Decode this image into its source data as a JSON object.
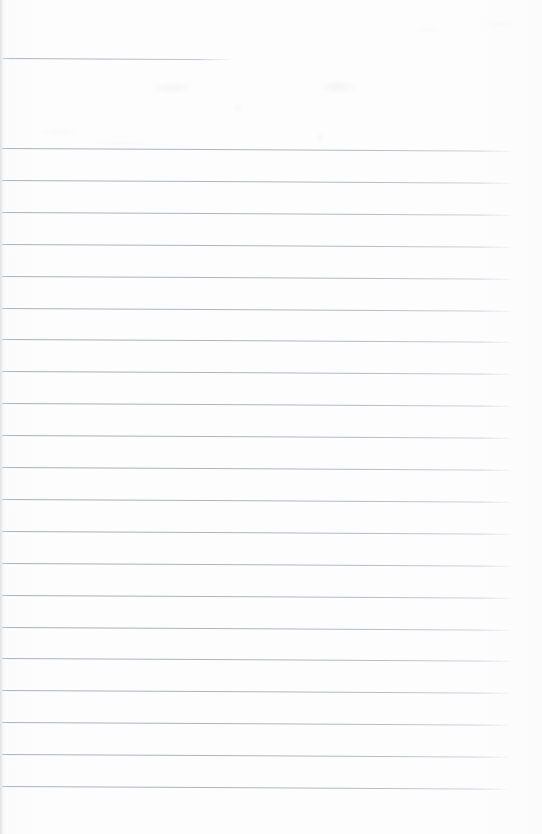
{
  "document": {
    "kind": "scanned-ruled-paper",
    "title": "Blank Lined Notebook Page",
    "page_width": 542,
    "page_height": 834,
    "body_text": "",
    "handwriting_present": "no",
    "printed_text_present": "no"
  },
  "colors": {
    "paper": "#fcfcfd",
    "page_edge": "#f6f6f7",
    "rule_line": "#a8acb2",
    "rule_line_faded": "#c4c7cc",
    "smudge": "#96989e"
  },
  "layout": {
    "left_margin_px": 2,
    "right_margin_px": 28,
    "first_rule_y": 148,
    "last_rule_y": 787,
    "rule_spacing_px": 31.9,
    "rule_count": 21,
    "page_skew_degrees": 0.3,
    "header_band_height_px": 148
  },
  "header_rule": {
    "label": "partial-width top rule",
    "x_start": 3,
    "x_end": 232,
    "y": 58,
    "length_px": 229
  },
  "rules": [
    {
      "index": 1,
      "y": 148.0,
      "x_start": 2,
      "x_end": 513
    },
    {
      "index": 2,
      "y": 179.9,
      "x_start": 2,
      "x_end": 513
    },
    {
      "index": 3,
      "y": 211.8,
      "x_start": 2,
      "x_end": 513
    },
    {
      "index": 4,
      "y": 243.7,
      "x_start": 2,
      "x_end": 513
    },
    {
      "index": 5,
      "y": 275.6,
      "x_start": 2,
      "x_end": 513
    },
    {
      "index": 6,
      "y": 307.5,
      "x_start": 2,
      "x_end": 513
    },
    {
      "index": 7,
      "y": 339.4,
      "x_start": 2,
      "x_end": 513
    },
    {
      "index": 8,
      "y": 371.3,
      "x_start": 2,
      "x_end": 513
    },
    {
      "index": 9,
      "y": 403.2,
      "x_start": 2,
      "x_end": 513
    },
    {
      "index": 10,
      "y": 435.1,
      "x_start": 2,
      "x_end": 513
    },
    {
      "index": 11,
      "y": 467.0,
      "x_start": 2,
      "x_end": 513
    },
    {
      "index": 12,
      "y": 498.9,
      "x_start": 2,
      "x_end": 513
    },
    {
      "index": 13,
      "y": 530.8,
      "x_start": 2,
      "x_end": 513
    },
    {
      "index": 14,
      "y": 562.7,
      "x_start": 2,
      "x_end": 513
    },
    {
      "index": 15,
      "y": 594.6,
      "x_start": 2,
      "x_end": 513
    },
    {
      "index": 16,
      "y": 626.5,
      "x_start": 2,
      "x_end": 512
    },
    {
      "index": 17,
      "y": 658.4,
      "x_start": 2,
      "x_end": 512
    },
    {
      "index": 18,
      "y": 690.3,
      "x_start": 2,
      "x_end": 511
    },
    {
      "index": 19,
      "y": 722.2,
      "x_start": 2,
      "x_end": 510
    },
    {
      "index": 20,
      "y": 754.1,
      "x_start": 2,
      "x_end": 509
    },
    {
      "index": 21,
      "y": 786.0,
      "x_start": 2,
      "x_end": 508
    }
  ]
}
